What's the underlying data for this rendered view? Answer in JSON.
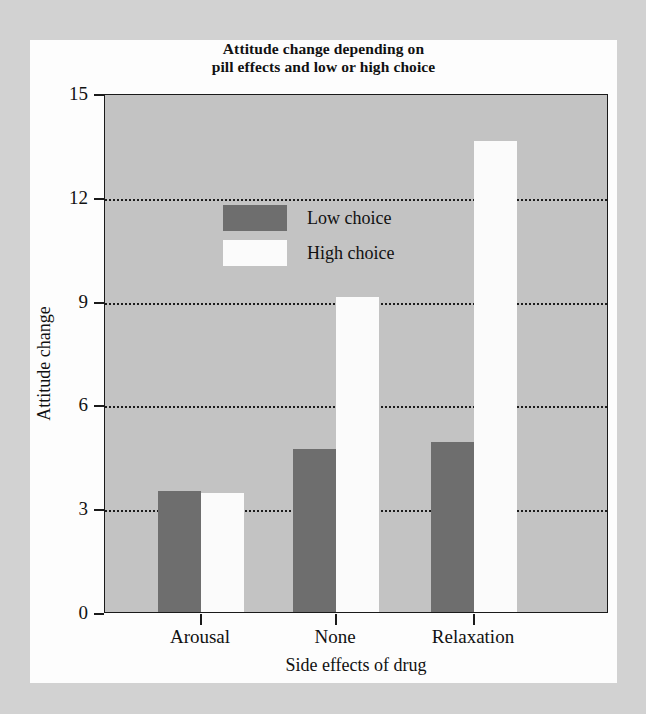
{
  "chart_data": {
    "type": "bar",
    "title": "Attitude change depending on pill effects and low or high choice",
    "title_line1": "Attitude change depending on",
    "title_line2": "pill effects and low or high choice",
    "xlabel": "Side effects of drug",
    "ylabel": "Attitude change",
    "categories": [
      "Arousal",
      "None",
      "Relaxation"
    ],
    "series": [
      {
        "name": "Low choice",
        "color": "#6e6e6e",
        "values": [
          3.5,
          4.7,
          4.9
        ]
      },
      {
        "name": "High choice",
        "color": "#fbfbfb",
        "values": [
          3.45,
          9.1,
          13.6
        ]
      }
    ],
    "ylim": [
      0,
      15
    ],
    "yticks": [
      0,
      3,
      6,
      9,
      12,
      15
    ],
    "ytick_labels": [
      "0",
      "3",
      "6",
      "9",
      "12",
      "15"
    ],
    "gridlines": [
      3,
      6,
      9,
      12
    ],
    "grid": "horizontal-dotted",
    "legend_position": "top-left-inside",
    "plot_background": "#c3c3c3"
  },
  "legend": {
    "items": [
      {
        "label": "Low choice"
      },
      {
        "label": "High choice"
      }
    ]
  }
}
